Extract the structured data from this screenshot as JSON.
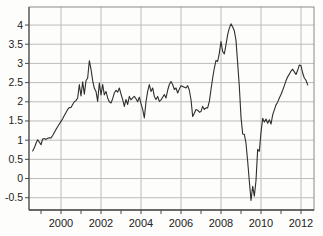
{
  "figure": {
    "background": "#fdfdfc"
  },
  "chart_data": {
    "type": "line",
    "title": "",
    "xlabel": "",
    "ylabel": "",
    "grid": true,
    "legend": "none",
    "xlim": [
      1998.4,
      2012.65
    ],
    "ylim": [
      -0.82,
      4.47
    ],
    "x_ticks": [
      2000,
      2002,
      2004,
      2006,
      2008,
      2010,
      2012
    ],
    "x_tick_labels": [
      "2000",
      "2002",
      "2004",
      "2006",
      "2008",
      "2010",
      "2012"
    ],
    "x_minor_ticks": [
      1999,
      2000,
      2001,
      2002,
      2003,
      2004,
      2005,
      2006,
      2007,
      2008,
      2009,
      2010,
      2011,
      2012
    ],
    "y_ticks": [
      -0.5,
      0,
      0.5,
      1,
      1.5,
      2,
      2.5,
      3,
      3.5,
      4
    ],
    "y_tick_labels": [
      "-0.5",
      "0",
      "0.5",
      "1",
      "1.5",
      "2",
      "2.5",
      "3",
      "3.5",
      "4"
    ],
    "colors": {
      "line": "#2e2e2e",
      "grid": "#bcbcbc",
      "frame": "#8a8a8a",
      "axis": "#4a4a4a",
      "labels": "#222222"
    },
    "series": [
      {
        "name": "rate",
        "x_start_year": 1998.5833,
        "x_step_years": 0.083333,
        "values": [
          0.72,
          0.8,
          0.92,
          1.01,
          0.95,
          0.88,
          1.03,
          1.04,
          1.02,
          1.05,
          1.06,
          1.06,
          1.12,
          1.2,
          1.28,
          1.35,
          1.42,
          1.49,
          1.56,
          1.64,
          1.72,
          1.8,
          1.85,
          1.85,
          1.93,
          2.0,
          2.03,
          2.1,
          2.45,
          2.15,
          2.52,
          2.2,
          2.55,
          2.62,
          3.07,
          2.85,
          2.55,
          2.35,
          2.27,
          2.01,
          2.49,
          2.18,
          2.45,
          2.18,
          2.27,
          2.1,
          2.0,
          1.97,
          2.08,
          2.23,
          2.3,
          2.25,
          2.36,
          2.2,
          2.06,
          1.88,
          2.06,
          1.93,
          2.14,
          2.05,
          2.1,
          2.14,
          2.08,
          2.0,
          2.12,
          1.95,
          1.8,
          1.58,
          2.0,
          2.27,
          2.45,
          2.27,
          2.36,
          2.14,
          2.06,
          2.14,
          2.01,
          2.05,
          2.12,
          2.19,
          2.1,
          2.3,
          2.45,
          2.53,
          2.45,
          2.32,
          2.36,
          2.23,
          2.33,
          2.42,
          2.4,
          2.38,
          2.36,
          2.42,
          2.3,
          2.06,
          1.62,
          1.7,
          1.8,
          1.78,
          1.73,
          1.75,
          1.88,
          1.8,
          1.84,
          1.84,
          2.01,
          2.32,
          2.62,
          2.88,
          3.08,
          3.05,
          3.27,
          3.57,
          3.31,
          3.25,
          3.49,
          3.75,
          3.92,
          4.03,
          3.95,
          3.85,
          3.6,
          3.0,
          2.4,
          1.6,
          1.16,
          1.15,
          0.92,
          0.45,
          -0.07,
          -0.57,
          -0.2,
          -0.46,
          -0.05,
          0.76,
          0.71,
          1.2,
          1.57,
          1.47,
          1.55,
          1.44,
          1.53,
          1.42,
          1.66,
          1.79,
          1.92,
          1.99,
          2.1,
          2.19,
          2.3,
          2.42,
          2.55,
          2.65,
          2.72,
          2.8,
          2.85,
          2.78,
          2.71,
          2.82,
          2.96,
          2.94,
          2.75,
          2.62,
          2.56,
          2.44
        ]
      }
    ]
  }
}
